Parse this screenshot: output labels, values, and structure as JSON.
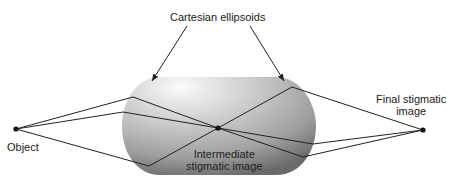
{
  "title_label": "Cartesian ellipsoids",
  "labels": {
    "object": "Object",
    "intermediate_line1": "Intermediate",
    "intermediate_line2": "stigmatic image",
    "final_line1": "Final stigmatic",
    "final_line2": "image"
  },
  "points": {
    "object": [
      16,
      129
    ],
    "intermediate": [
      218,
      128
    ],
    "final": [
      423,
      130
    ]
  },
  "colors": {
    "line": "#222222",
    "lens_light": "#f4f4f4",
    "lens_dark": "#6e6e6e",
    "text": "#222222"
  }
}
